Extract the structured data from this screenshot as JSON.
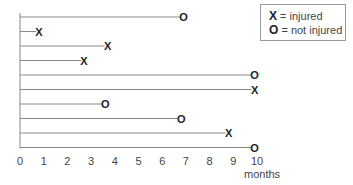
{
  "chart_data": {
    "type": "scatter",
    "subtype": "survival-timeline",
    "title": "",
    "xlabel": "months",
    "ylabel": "",
    "xlim": [
      0,
      10
    ],
    "x_ticks": [
      0,
      1,
      2,
      3,
      4,
      5,
      6,
      7,
      8,
      9,
      10
    ],
    "grid": false,
    "legend_position": "top-right",
    "legend": [
      {
        "marker": "X",
        "label": "= injured"
      },
      {
        "marker": "O",
        "label": "= not injured"
      }
    ],
    "rows": [
      {
        "subject": 1,
        "end": 6.9,
        "outcome": "not injured",
        "marker": "O"
      },
      {
        "subject": 2,
        "end": 0.8,
        "outcome": "injured",
        "marker": "X"
      },
      {
        "subject": 3,
        "end": 3.7,
        "outcome": "injured",
        "marker": "X"
      },
      {
        "subject": 4,
        "end": 2.7,
        "outcome": "injured",
        "marker": "X"
      },
      {
        "subject": 5,
        "end": 9.9,
        "outcome": "not injured",
        "marker": "O"
      },
      {
        "subject": 6,
        "end": 9.9,
        "outcome": "injured",
        "marker": "X"
      },
      {
        "subject": 7,
        "end": 3.6,
        "outcome": "not injured",
        "marker": "O"
      },
      {
        "subject": 8,
        "end": 6.8,
        "outcome": "not injured",
        "marker": "O"
      },
      {
        "subject": 9,
        "end": 8.8,
        "outcome": "injured",
        "marker": "X"
      },
      {
        "subject": 10,
        "end": 9.9,
        "outcome": "not injured",
        "marker": "O"
      }
    ]
  },
  "legend": {
    "injured_marker": "X",
    "injured_label": "= injured",
    "not_injured_marker": "O",
    "not_injured_label": "= not injured"
  },
  "axis": {
    "x_label": "months"
  },
  "colors": {
    "line": "#8a8a8a",
    "marker": "#222222",
    "tick_text": "#444444"
  }
}
